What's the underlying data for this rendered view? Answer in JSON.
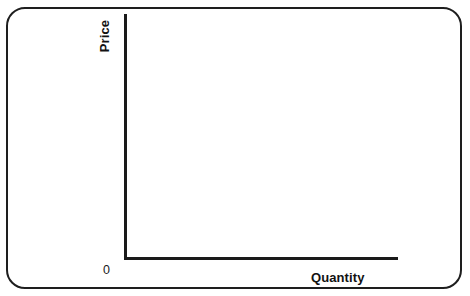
{
  "figure": {
    "frame": {
      "shape": "rounded-rectangle",
      "border_color": "#1e1e1e",
      "background": "#ffffff"
    },
    "axis_color": "#1a1a1a",
    "origin_label": "0"
  },
  "chart_data": {
    "type": "line",
    "title": "",
    "subtitle": "",
    "xlabel": "Quantity",
    "ylabel": "Price",
    "series": [],
    "x": [],
    "categories": [],
    "values": [],
    "tick_labels": {
      "x": [],
      "y": []
    },
    "annotations": [
      "0"
    ],
    "grid": false,
    "legend": false,
    "legend_position": "none",
    "xlim": [
      0,
      null
    ],
    "ylim": [
      0,
      null
    ]
  }
}
